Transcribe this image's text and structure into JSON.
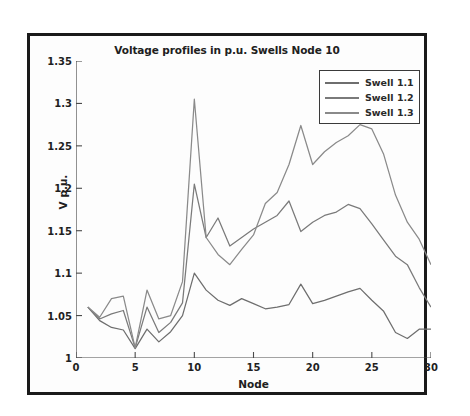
{
  "chart_data": {
    "type": "line",
    "title": "Voltage profiles in p.u. Swells Node 10",
    "xlabel": "Node",
    "ylabel": "V p.u.",
    "xlim": [
      0,
      30
    ],
    "ylim": [
      1,
      1.35
    ],
    "xticks": [
      0,
      5,
      10,
      15,
      20,
      25,
      30
    ],
    "xticklabels": [
      "0",
      "5",
      "10",
      "15",
      "20",
      "25",
      "30"
    ],
    "yticks": [
      1,
      1.05,
      1.1,
      1.15,
      1.2,
      1.25,
      1.3,
      1.35
    ],
    "yticklabels": [
      "1",
      "1.05",
      "1.1",
      "1.15",
      "1.2",
      "1.25",
      "1.3",
      "1.35"
    ],
    "grid": false,
    "legend_position": "upper right",
    "x": [
      1,
      2,
      3,
      4,
      5,
      6,
      7,
      8,
      9,
      10,
      11,
      12,
      13,
      14,
      15,
      16,
      17,
      18,
      19,
      20,
      21,
      22,
      23,
      24,
      25,
      26,
      27,
      28,
      29,
      30
    ],
    "series": [
      {
        "name": "Swell 1.1",
        "color": "#6e6e6e",
        "values": [
          1.06,
          1.044,
          1.036,
          1.033,
          1.011,
          1.034,
          1.019,
          1.031,
          1.05,
          1.1,
          1.08,
          1.068,
          1.062,
          1.07,
          1.064,
          1.058,
          1.06,
          1.063,
          1.087,
          1.064,
          1.068,
          1.073,
          1.078,
          1.082,
          1.068,
          1.055,
          1.03,
          1.023,
          1.034,
          1.034
        ]
      },
      {
        "name": "Swell 1.2",
        "color": "#7a7a7a",
        "values": [
          1.06,
          1.046,
          1.052,
          1.056,
          1.012,
          1.06,
          1.03,
          1.042,
          1.065,
          1.205,
          1.142,
          1.165,
          1.132,
          1.142,
          1.152,
          1.16,
          1.168,
          1.185,
          1.149,
          1.16,
          1.168,
          1.172,
          1.181,
          1.176,
          1.158,
          1.139,
          1.12,
          1.11,
          1.083,
          1.06
        ]
      },
      {
        "name": "Swell 1.3",
        "color": "#8a8a8a",
        "values": [
          1.06,
          1.048,
          1.07,
          1.073,
          1.012,
          1.08,
          1.046,
          1.05,
          1.09,
          1.305,
          1.142,
          1.122,
          1.11,
          1.128,
          1.145,
          1.182,
          1.195,
          1.228,
          1.274,
          1.228,
          1.243,
          1.254,
          1.262,
          1.275,
          1.27,
          1.24,
          1.192,
          1.16,
          1.14,
          1.11
        ]
      }
    ]
  },
  "legend": {
    "items": [
      {
        "label": "Swell 1.1"
      },
      {
        "label": "Swell 1.2"
      },
      {
        "label": "Swell 1.3"
      }
    ]
  }
}
